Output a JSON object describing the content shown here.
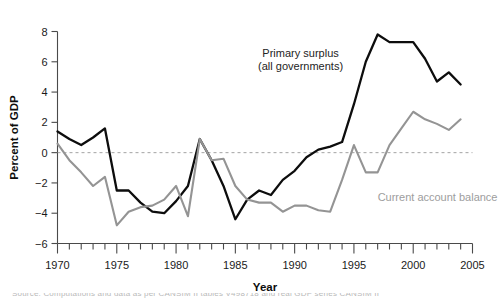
{
  "chart_data": {
    "type": "line",
    "title": "",
    "xlabel": "Year",
    "ylabel": "Percent of GDP",
    "xlim": [
      1970,
      2005
    ],
    "ylim": [
      -6,
      8
    ],
    "grid": false,
    "zero_reference_line": true,
    "legend_position": "inline-annotations",
    "x_major_ticks": [
      1970,
      1975,
      1980,
      1985,
      1990,
      1995,
      2000,
      2005
    ],
    "x_major_tick_labels": [
      "1970",
      "1975",
      "1980",
      "1985",
      "1990",
      "1995",
      "2000",
      "2005"
    ],
    "x_minor_tick_interval": 1,
    "y_ticks": [
      -6,
      -4,
      -2,
      0,
      2,
      4,
      6,
      8
    ],
    "y_tick_labels": [
      "−6",
      "−4",
      "−2",
      "0",
      "2",
      "4",
      "6",
      "8"
    ],
    "x": [
      1970,
      1971,
      1972,
      1973,
      1974,
      1975,
      1976,
      1977,
      1978,
      1979,
      1980,
      1981,
      1982,
      1983,
      1984,
      1985,
      1986,
      1987,
      1988,
      1989,
      1990,
      1991,
      1992,
      1993,
      1994,
      1995,
      1996,
      1997,
      1998,
      1999,
      2000,
      2001,
      2002,
      2003,
      2004
    ],
    "series": [
      {
        "name": "Primary surplus (all governments)",
        "color": "#0d0d0d",
        "values": [
          1.4,
          0.9,
          0.5,
          1.0,
          1.6,
          -2.5,
          -2.5,
          -3.3,
          -3.9,
          -4.0,
          -3.2,
          -2.2,
          0.9,
          -0.5,
          -2.2,
          -4.4,
          -3.1,
          -2.5,
          -2.8,
          -1.8,
          -1.2,
          -0.3,
          0.2,
          0.4,
          0.7,
          3.2,
          6.0,
          7.8,
          7.3,
          7.3,
          7.3,
          6.2,
          4.7,
          5.3,
          4.5
        ]
      },
      {
        "name": "Current account balance",
        "color": "#949494",
        "values": [
          0.6,
          -0.5,
          -1.3,
          -2.2,
          -1.6,
          -4.8,
          -3.9,
          -3.6,
          -3.5,
          -3.1,
          -2.2,
          -4.2,
          0.9,
          -0.5,
          -0.4,
          -2.2,
          -3.1,
          -3.3,
          -3.3,
          -3.9,
          -3.5,
          -3.5,
          -3.8,
          -3.9,
          -1.8,
          0.5,
          -1.3,
          -1.3,
          0.5,
          1.6,
          2.7,
          2.2,
          1.9,
          1.5,
          2.2
        ]
      }
    ],
    "annotations": [
      {
        "name": "primary-surplus-label",
        "lines": [
          "Primary surplus",
          "(all governments)"
        ],
        "color": "#242424",
        "x": 1990.5,
        "y": 6.3
      },
      {
        "name": "current-account-label",
        "lines": [
          "Current account balance"
        ],
        "color": "#9d9d9d",
        "x": 1997.0,
        "y": -3.2
      }
    ]
  },
  "axes": {
    "y_title": "Percent of GDP",
    "x_title": "Year"
  },
  "footer": {
    "source_text": "Source: Computations and data as per CANSIM II tables V498718 and real GDP series CANSIM II"
  }
}
